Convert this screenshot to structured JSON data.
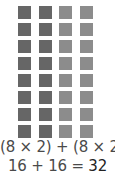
{
  "array_model": {
    "rows": 8,
    "columns": 4,
    "column_colors": [
      "#666666",
      "#666666",
      "#8c8c8c",
      "#8c8c8c"
    ]
  },
  "equations": {
    "line1": {
      "part1": "(8 × 2)",
      "plus": " + ",
      "part2": "(8 × 2)"
    },
    "line2": {
      "part1": "16 + 16 = ",
      "result": "32"
    }
  }
}
